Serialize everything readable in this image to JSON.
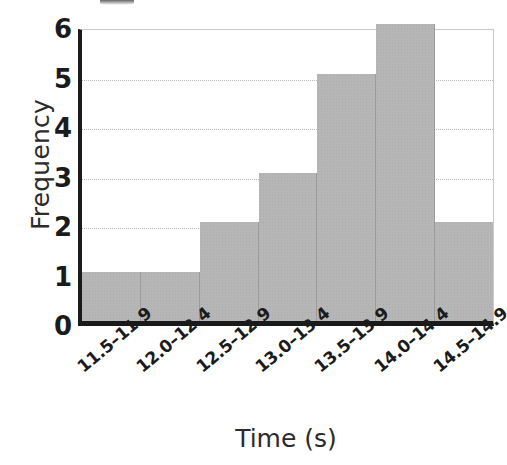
{
  "chart_data": {
    "type": "bar",
    "title": "",
    "xlabel": "Time (s)",
    "ylabel": "Frequency",
    "categories": [
      "11.5–11.9",
      "12.0–12.4",
      "12.5–12.9",
      "13.0–13.4",
      "13.5–13.9",
      "14.0–14.4",
      "14.5–14.9"
    ],
    "values": [
      1,
      1,
      2,
      3,
      5,
      6,
      2
    ],
    "ylim": [
      0,
      6
    ],
    "yticks": [
      0,
      1,
      2,
      3,
      4,
      5,
      6
    ],
    "ytick_labels": [
      "0",
      "1",
      "2",
      "3",
      "4",
      "5",
      "6"
    ],
    "gridlines": [
      2,
      3,
      4,
      5
    ],
    "grid": true,
    "legend": false,
    "bar_color": "#b6b6b6",
    "axis_color": "#1a1a1a",
    "grid_color": "#b9b9b9"
  },
  "artifacts": {
    "cropped_title_remnant": true
  }
}
